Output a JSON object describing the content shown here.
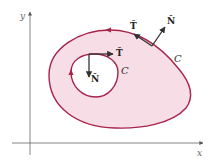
{
  "axes": {
    "x_label": "x",
    "y_label": "y",
    "color": "#555555"
  },
  "region": {
    "fill": "#f7dde6",
    "stroke": "#a8234a"
  },
  "outer_curve": {
    "label": "C",
    "tangent_label": "T̂",
    "normal_label": "N̂"
  },
  "inner_curve": {
    "label": "C",
    "tangent_label": "T̂",
    "normal_label": "N̂"
  },
  "vector_color": "#222222"
}
